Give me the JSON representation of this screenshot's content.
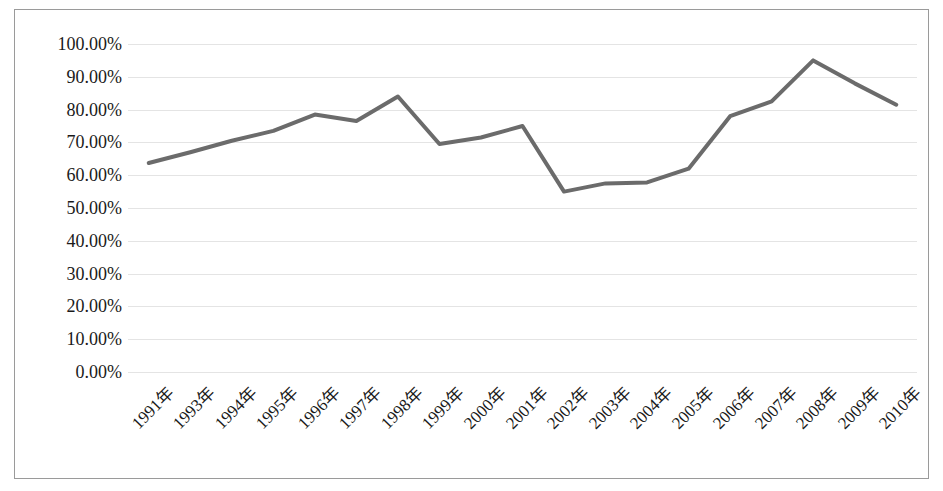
{
  "chart_data": {
    "type": "line",
    "title": "",
    "subtitle": "",
    "xlabel": "",
    "ylabel": "",
    "categories": [
      "1991年",
      "1993年",
      "1994年",
      "1995年",
      "1996年",
      "1997年",
      "1998年",
      "1999年",
      "2000年",
      "2001年",
      "2002年",
      "2003年",
      "2004年",
      "2005年",
      "2006年",
      "2007年",
      "2008年",
      "2009年",
      "2010年"
    ],
    "series": [
      {
        "name": "",
        "values": [
          63.7,
          67.0,
          70.5,
          73.5,
          78.5,
          76.5,
          84.0,
          69.5,
          71.5,
          75.0,
          55.0,
          57.5,
          57.8,
          62.0,
          78.0,
          82.5,
          95.0,
          88.0,
          81.5
        ]
      }
    ],
    "ylim": [
      0,
      100
    ],
    "ytick_labels": [
      "100.00%",
      "90.00%",
      "80.00%",
      "70.00%",
      "60.00%",
      "50.00%",
      "40.00%",
      "30.00%",
      "20.00%",
      "10.00%",
      "0.00%"
    ],
    "ytick_values": [
      100,
      90,
      80,
      70,
      60,
      50,
      40,
      30,
      20,
      10,
      0
    ],
    "grid": true,
    "legend": "none",
    "value_format": "percent",
    "colors": {
      "line": "#6b6b6b",
      "gridline": "#e4e4e4",
      "border": "#9a9a9a",
      "background": "#ffffff",
      "text": "#1a1a1a"
    }
  }
}
